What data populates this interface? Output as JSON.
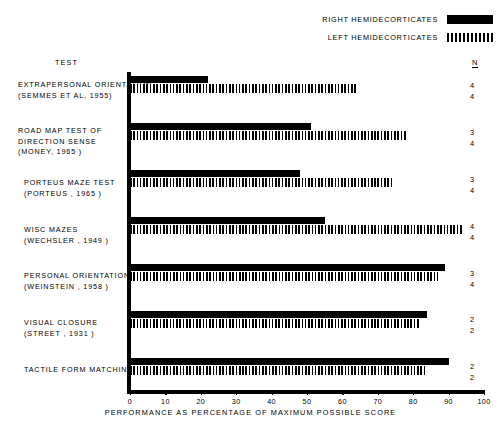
{
  "legend": {
    "items": [
      {
        "label": "RIGHT  HEMIDECORTICATES",
        "style": "solid",
        "swatch_name": "legend-swatch-right"
      },
      {
        "label": "LEFT  HEMIDECORTICATES",
        "style": "hatched",
        "swatch_name": "legend-swatch-left"
      }
    ]
  },
  "headers": {
    "test": "TEST",
    "n": "N"
  },
  "axis": {
    "xlabel": "PERFORMANCE  AS  PERCENTAGE  OF  MAXIMUM  POSSIBLE  SCORE",
    "ticklabels": [
      "0",
      "10",
      "20",
      "30",
      "40",
      "50",
      "60",
      "70",
      "80",
      "90",
      "100"
    ]
  },
  "rows": [
    {
      "label": "EXTRAPERSONAL ORIENTATION\n(SEMMES ET AL, 1955)",
      "n_right": "4",
      "n_left": "4"
    },
    {
      "label": "ROAD MAP TEST OF\nDIRECTION SENSE\n(MONEY, 1965 )",
      "n_right": "3",
      "n_left": "4"
    },
    {
      "label": "PORTEUS  MAZE  TEST\n(PORTEUS , 1965 )",
      "n_right": "3",
      "n_left": "4"
    },
    {
      "label": "WISC  MAZES\n(WECHSLER , 1949 )",
      "n_right": "4",
      "n_left": "4"
    },
    {
      "label": "PERSONAL  ORIENTATION\n(WEINSTEIN , 1958 )",
      "n_right": "3",
      "n_left": "4"
    },
    {
      "label": "VISUAL  CLOSURE\n(STREET , 1931 )",
      "n_right": "2",
      "n_left": "2"
    },
    {
      "label": "TACTILE  FORM  MATCHING",
      "n_right": "2",
      "n_left": "2"
    }
  ],
  "chart_data": {
    "type": "bar",
    "orientation": "horizontal",
    "title": "",
    "xlabel": "PERFORMANCE  AS  PERCENTAGE  OF  MAXIMUM  POSSIBLE  SCORE",
    "ylabel": "TEST",
    "xlim": [
      0,
      100
    ],
    "xticks": [
      0,
      10,
      20,
      30,
      40,
      50,
      60,
      70,
      80,
      90,
      100
    ],
    "grid": false,
    "legend_position": "top-right",
    "categories": [
      "EXTRAPERSONAL ORIENTATION (SEMMES ET AL, 1955)",
      "ROAD MAP TEST OF DIRECTION SENSE (MONEY, 1965)",
      "PORTEUS MAZE TEST (PORTEUS, 1965)",
      "WISC MAZES (WECHSLER, 1949)",
      "PERSONAL ORIENTATION (WEINSTEIN, 1958)",
      "VISUAL CLOSURE (STREET, 1931)",
      "TACTILE FORM MATCHING"
    ],
    "series": [
      {
        "name": "RIGHT HEMIDECORTICATES",
        "style": "solid",
        "values": [
          22,
          51,
          48,
          55,
          89,
          84,
          90
        ],
        "n": [
          4,
          3,
          3,
          4,
          3,
          2,
          2
        ]
      },
      {
        "name": "LEFT HEMIDECORTICATES",
        "style": "hatched",
        "values": [
          64,
          78,
          74,
          94,
          87,
          82,
          84
        ],
        "n": [
          4,
          4,
          4,
          4,
          4,
          2,
          2
        ]
      }
    ]
  }
}
